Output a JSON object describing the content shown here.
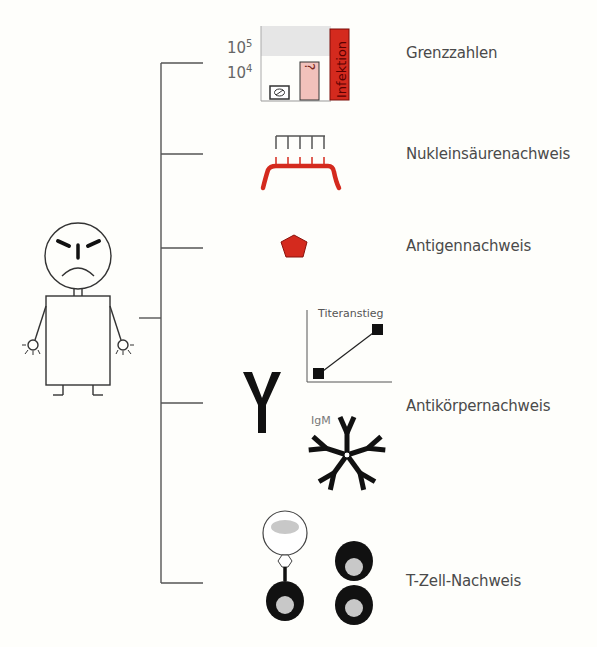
{
  "diagram": {
    "categories": [
      {
        "id": "grenzzahlen",
        "label": "Grenzzahlen"
      },
      {
        "id": "nukleinsaeure",
        "label": "Nukleinsäurenachweis"
      },
      {
        "id": "antigen",
        "label": "Antigennachweis"
      },
      {
        "id": "antikoerper",
        "label": "Antikörpernachweis"
      },
      {
        "id": "tzell",
        "label": "T-Zell-Nachweis"
      }
    ],
    "grenzzahlen_chart": {
      "y_ticks": [
        {
          "base": "10",
          "exp": "5"
        },
        {
          "base": "10",
          "exp": "4"
        }
      ],
      "bars": [
        {
          "label": "⊘",
          "meaning": "no-infection"
        },
        {
          "label": "?",
          "meaning": "uncertain"
        },
        {
          "label": "Infektion",
          "meaning": "infection"
        }
      ]
    },
    "antikoerper": {
      "titer_label": "Titeranstieg",
      "igm_label": "IgM",
      "antibody_glyph": "Y"
    },
    "colors": {
      "red": "#d42a1e",
      "pink": "#f2c1bb",
      "line": "#555555",
      "black": "#111111",
      "gray_fill": "#c8c8c8"
    }
  }
}
